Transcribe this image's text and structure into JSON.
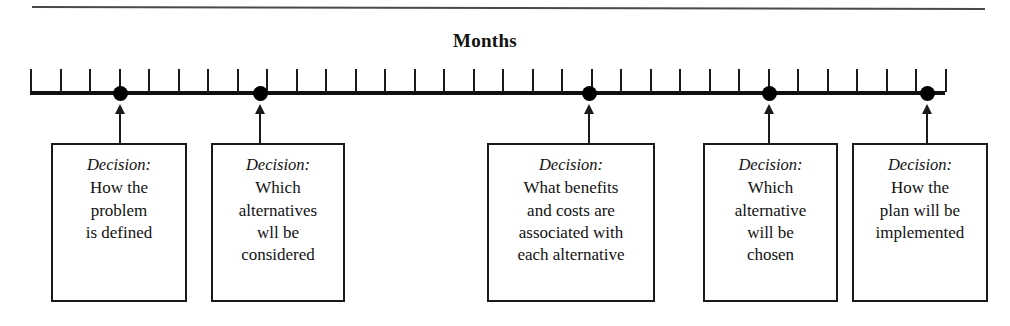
{
  "figure": {
    "title": "Months",
    "top_rule": true
  },
  "axis": {
    "tick_count": 32,
    "start_x": 30,
    "end_x": 945,
    "tick_spacing": 29.5
  },
  "chart_data": {
    "type": "timeline",
    "title": "Months",
    "xlabel": "Months",
    "ylabel": "",
    "axis_label": "Months",
    "tick_count": 32,
    "milestones": [
      {
        "index": 1,
        "month": 3,
        "x": 120,
        "label": "Decision:",
        "lines": [
          "How the",
          "problem",
          "is defined"
        ]
      },
      {
        "index": 2,
        "month": 8,
        "x": 260,
        "label": "Decision:",
        "lines": [
          "Which",
          "alternatives",
          "wll be",
          "considered"
        ]
      },
      {
        "index": 3,
        "month": 19,
        "x": 589,
        "label": "Decision:",
        "lines": [
          "What benefits",
          "and costs are",
          "associated with",
          "each alternative"
        ]
      },
      {
        "index": 4,
        "month": 25,
        "x": 769,
        "label": "Decision:",
        "lines": [
          "Which",
          "alternative",
          "will be",
          "chosen"
        ]
      },
      {
        "index": 5,
        "month": 30,
        "x": 927,
        "label": "Decision:",
        "lines": [
          "How the",
          "plan will be",
          "implemented"
        ]
      }
    ]
  },
  "boxes": [
    {
      "id": "box-1",
      "left": 51,
      "top": 143,
      "width": 136,
      "height": 159,
      "label": "Decision:",
      "lines": [
        "How the",
        "problem",
        "is defined"
      ],
      "connector_x": 120
    },
    {
      "id": "box-2",
      "left": 211,
      "top": 143,
      "width": 134,
      "height": 159,
      "label": "Decision:",
      "lines": [
        "Which",
        "alternatives",
        "wll be",
        "considered"
      ],
      "connector_x": 260
    },
    {
      "id": "box-3",
      "left": 487,
      "top": 143,
      "width": 168,
      "height": 159,
      "label": "Decision:",
      "lines": [
        "What benefits",
        "and costs are",
        "associated with",
        "each alternative"
      ],
      "connector_x": 589
    },
    {
      "id": "box-4",
      "left": 703,
      "top": 143,
      "width": 135,
      "height": 159,
      "label": "Decision:",
      "lines": [
        "Which",
        "alternative",
        "will be",
        "chosen"
      ],
      "connector_x": 769
    },
    {
      "id": "box-5",
      "left": 852,
      "top": 143,
      "width": 136,
      "height": 159,
      "label": "Decision:",
      "lines": [
        "How the",
        "plan will be",
        "implemented"
      ],
      "connector_x": 927
    }
  ],
  "colors": {
    "ink": "#101010",
    "rule": "#4a4a4a",
    "background": "#ffffff"
  }
}
